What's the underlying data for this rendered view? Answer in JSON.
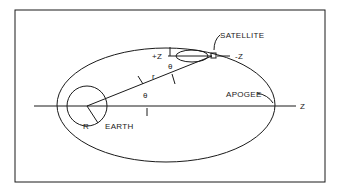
{
  "diagram": {
    "labels": {
      "satellite": "SATELLITE",
      "plus_z": "+Z",
      "minus_z": "-Z",
      "theta_upper": "θ",
      "theta_lower": "θ",
      "radius_vector": "r",
      "apogee": "APOGEE",
      "z_axis": "Z",
      "earth_radius": "R",
      "earth": "EARTH"
    },
    "colors": {
      "line": "#1a1a1a",
      "background": "#ffffff"
    }
  }
}
